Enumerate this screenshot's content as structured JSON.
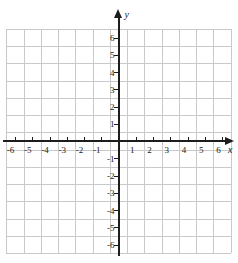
{
  "chart_data": {
    "type": "scatter",
    "title": "",
    "subtitle": "",
    "xlabel": "x",
    "ylabel": "y",
    "xlim": [
      -7,
      7
    ],
    "ylim": [
      -7,
      7
    ],
    "grid": true,
    "legend": null,
    "series": [],
    "annotations": [],
    "x_tick_labels": [
      "-6",
      "-5",
      "-4",
      "-3",
      "-2",
      "-1",
      "1",
      "2",
      "3",
      "4",
      "5",
      "6"
    ],
    "x_tick_values": [
      -6,
      -5,
      -4,
      -3,
      -2,
      -1,
      1,
      2,
      3,
      4,
      5,
      6
    ],
    "y_tick_labels": [
      "6",
      "5",
      "4",
      "3",
      "2",
      "1",
      "-1",
      "-2",
      "-3",
      "-4",
      "-5",
      "-6"
    ],
    "y_tick_values": [
      6,
      5,
      4,
      3,
      2,
      1,
      -1,
      -2,
      -3,
      -4,
      -5,
      -6
    ],
    "origin_label": "",
    "colors": {
      "grid": "#c9c9c9",
      "axis": "#1d1d1d",
      "label": "#1a1a1a",
      "background": "#ffffff"
    }
  },
  "axes": {
    "x_name": "x",
    "y_name": "y"
  }
}
